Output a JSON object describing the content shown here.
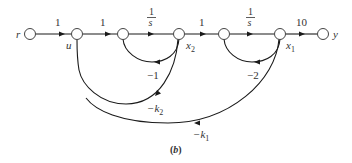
{
  "diagram": {
    "type": "signal-flow-graph",
    "caption": "(b)",
    "caption_letter": "b",
    "nodes": [
      {
        "id": "r",
        "label": "r"
      },
      {
        "id": "u",
        "label": "u"
      },
      {
        "id": "n3",
        "label": ""
      },
      {
        "id": "x2",
        "label": "x",
        "sub": "2"
      },
      {
        "id": "n5",
        "label": ""
      },
      {
        "id": "x1",
        "label": "x",
        "sub": "1"
      },
      {
        "id": "y",
        "label": "y"
      }
    ],
    "forward_gains": {
      "r_u": "1",
      "u_n3": "1",
      "n3_x2_num": "1",
      "n3_x2_den": "s",
      "x2_n5": "1",
      "n5_x1_num": "1",
      "n5_x1_den": "s",
      "x1_y": "10"
    },
    "feedback_gains": {
      "x2_n3": "−1",
      "x1_n5": "−2",
      "x2_u_prefix": "−k",
      "x2_u_sub": "2",
      "x1_u_prefix": "−k",
      "x1_u_sub": "1"
    }
  }
}
